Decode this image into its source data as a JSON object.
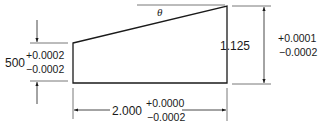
{
  "figure": {
    "angle_label": "θ",
    "dimensions": {
      "left_height": {
        "nominal": "500",
        "plus": "+0.0002",
        "minus": "−0.0002"
      },
      "right_height": {
        "nominal": "1.125",
        "plus": "+0.0001",
        "minus": "−0.0002"
      },
      "bottom_width": {
        "nominal": "2.000",
        "plus": "+0.0000",
        "minus": "−0.0002"
      }
    },
    "colors": {
      "line": "#1a1a1a",
      "extension": "#555555",
      "background": "#ffffff"
    }
  }
}
